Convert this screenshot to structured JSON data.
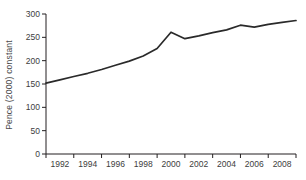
{
  "chart_data": {
    "type": "line",
    "title": "",
    "ylabel": "Pence (2000) constant",
    "xlabel": "",
    "x": [
      1991,
      1992,
      1993,
      1994,
      1995,
      1996,
      1997,
      1998,
      1999,
      2000,
      2001,
      2002,
      2003,
      2004,
      2005,
      2006,
      2007,
      2008,
      2009
    ],
    "values": [
      152,
      159,
      166,
      173,
      181,
      190,
      199,
      210,
      226,
      261,
      247,
      253,
      260,
      266,
      276,
      272,
      278,
      282,
      286
    ],
    "xlim": [
      1991,
      2009
    ],
    "ylim": [
      0,
      300
    ],
    "y_ticks": [
      0,
      50,
      100,
      150,
      200,
      250,
      300
    ],
    "x_tick_marks": [
      1991,
      1993,
      1995,
      1997,
      1999,
      2001,
      2003,
      2005,
      2007,
      2009
    ],
    "x_tick_labels": [
      "1992",
      "1994",
      "1996",
      "1998",
      "2000",
      "2002",
      "2004",
      "2006",
      "2008"
    ],
    "x_tick_label_positions": [
      1992,
      1994,
      1996,
      1998,
      2000,
      2002,
      2004,
      2006,
      2008
    ],
    "grid": "off",
    "legend": "none",
    "colors": {
      "line": "#2a2a2a",
      "axis": "#231f20",
      "tick_label": "#3d3d3d",
      "axis_title": "#4a4a4a",
      "background": "#ffffff"
    }
  }
}
